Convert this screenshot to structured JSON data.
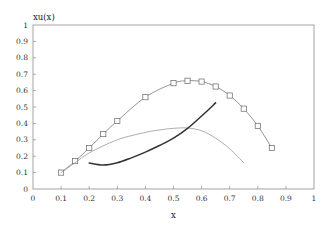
{
  "chart_data": {
    "type": "line",
    "title": "",
    "xlabel": "x",
    "ylabel": "xu(x)",
    "xlim": [
      0,
      1
    ],
    "ylim": [
      0,
      1
    ],
    "grid": false,
    "legend": null,
    "xticks": [
      0,
      0.1,
      0.2,
      0.3,
      0.4,
      0.5,
      0.6,
      0.7,
      0.8,
      0.9,
      1
    ],
    "xtick_labels": [
      "0",
      "0.1",
      "0.2",
      "0.3",
      "0.4",
      "0.5",
      "0.6",
      "0.7",
      "0.8",
      "0.9",
      "1"
    ],
    "yticks": [
      0,
      0.1,
      0.2,
      0.3,
      0.4,
      0.5,
      0.6,
      0.7,
      0.8,
      0.9,
      1
    ],
    "ytick_labels": [
      "0",
      "0.1",
      "0.2",
      "0.3",
      "0.4",
      "0.5",
      "0.6",
      "0.7",
      "0.8",
      "0.9",
      "1"
    ],
    "series": [
      {
        "name": "data with square markers",
        "style": "thin line with open square markers",
        "color": "#777777",
        "x": [
          0.1,
          0.15,
          0.2,
          0.25,
          0.3,
          0.4,
          0.5,
          0.55,
          0.6,
          0.65,
          0.7,
          0.75,
          0.8,
          0.85
        ],
        "y": [
          0.1,
          0.17,
          0.25,
          0.335,
          0.415,
          0.56,
          0.645,
          0.66,
          0.655,
          0.625,
          0.57,
          0.49,
          0.385,
          0.25
        ]
      },
      {
        "name": "thin curve",
        "style": "thin line",
        "color": "#8a8a8a",
        "x": [
          0.1,
          0.15,
          0.2,
          0.3,
          0.4,
          0.45,
          0.5,
          0.55,
          0.6,
          0.65,
          0.7,
          0.75
        ],
        "y": [
          0.1,
          0.16,
          0.22,
          0.3,
          0.345,
          0.36,
          0.37,
          0.372,
          0.355,
          0.31,
          0.245,
          0.16
        ]
      },
      {
        "name": "thick curve",
        "style": "thick line",
        "color": "#333333",
        "x": [
          0.2,
          0.25,
          0.3,
          0.35,
          0.4,
          0.45,
          0.5,
          0.55,
          0.6,
          0.65
        ],
        "y": [
          0.158,
          0.146,
          0.16,
          0.19,
          0.225,
          0.265,
          0.31,
          0.37,
          0.445,
          0.525
        ]
      }
    ]
  }
}
